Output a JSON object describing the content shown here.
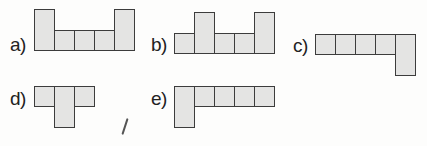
{
  "diagram": {
    "colors": {
      "square_fill": "#e4e4e3",
      "square_border": "#3c3c3c",
      "background": "#fdfdfc",
      "label": "#222222"
    },
    "figures": [
      {
        "label": "a)",
        "shape": "U-shape: 5 squares in a row with end columns extended upward (tall ends)"
      },
      {
        "label": "b)",
        "shape": "5 squares in a row; 2nd and 5th squares extended upward"
      },
      {
        "label": "c)",
        "shape": "4 squares in a row, 5th square extended downward (L-shape)"
      },
      {
        "label": "d)",
        "shape": "T-shape: 3 squares in a row with center extended downward"
      },
      {
        "label": "e)",
        "shape": "5 squares in a row with first square extended downward"
      }
    ]
  }
}
